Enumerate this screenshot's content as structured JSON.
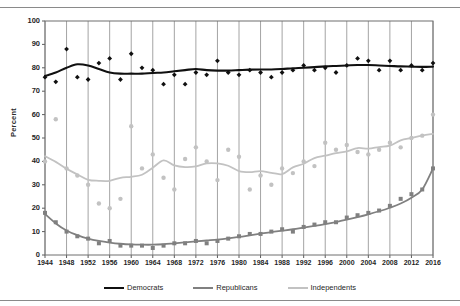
{
  "figure": {
    "title": "",
    "title_note": "title row is cropped off the top edge of the screenshot",
    "bottom_rule": true
  },
  "axes": {
    "ylabel": "Percent",
    "yticks": [
      "0",
      "10",
      "20",
      "30",
      "40",
      "50",
      "60",
      "70",
      "80",
      "90",
      "100"
    ],
    "xticks": [
      "1944",
      "1948",
      "1952",
      "1956",
      "1960",
      "1964",
      "1968",
      "1972",
      "1976",
      "1980",
      "1984",
      "1988",
      "1992",
      "1996",
      "2000",
      "2004",
      "2008",
      "2012",
      "2016"
    ]
  },
  "legend": {
    "items": [
      {
        "label": "Democrats",
        "color": "#101010"
      },
      {
        "label": "Republicans",
        "color": "#808080"
      },
      {
        "label": "Independents",
        "color": "#c2c2c2"
      }
    ]
  },
  "chart_data": {
    "type": "scatter",
    "title": "",
    "xlabel": "",
    "ylabel": "Percent",
    "xlim": [
      1944,
      2016
    ],
    "ylim": [
      0,
      100
    ],
    "ytick_step": 10,
    "xtick_step": 4,
    "grid": "vertical",
    "legend_position": "bottom-center",
    "marker_shapes": {
      "Democrats": "diamond",
      "Republicans": "square",
      "Independents": "circle"
    },
    "has_trend_lines": true,
    "x": [
      1944,
      1946,
      1948,
      1950,
      1952,
      1954,
      1956,
      1958,
      1960,
      1962,
      1964,
      1966,
      1968,
      1970,
      1972,
      1974,
      1976,
      1978,
      1980,
      1982,
      1984,
      1986,
      1988,
      1990,
      1992,
      1994,
      1996,
      1998,
      2000,
      2002,
      2004,
      2006,
      2008,
      2010,
      2012,
      2014,
      2016
    ],
    "series": [
      {
        "name": "Democrats",
        "color": "#101010",
        "values": [
          76,
          74,
          88,
          76,
          75,
          82,
          84,
          75,
          86,
          80,
          79,
          73,
          77,
          73,
          78,
          77,
          83,
          78,
          77,
          79,
          78,
          76,
          78,
          79,
          81,
          79,
          80,
          78,
          81,
          84,
          83,
          79,
          83,
          79,
          81,
          79,
          82
        ],
        "trend": [
          76.5,
          78,
          80,
          81.5,
          81,
          79.5,
          78,
          77.5,
          77.5,
          77.5,
          77.8,
          78,
          78.5,
          79,
          79.5,
          79,
          78.8,
          78.8,
          79,
          79.2,
          79.3,
          79.3,
          79.5,
          79.8,
          80,
          80.3,
          80.6,
          80.8,
          81,
          81.2,
          81.2,
          81,
          80.8,
          80.6,
          80.5,
          80.4,
          80.5
        ]
      },
      {
        "name": "Republicans",
        "color": "#808080",
        "values": [
          18,
          14,
          10,
          8,
          7,
          5,
          6,
          4,
          4,
          4,
          3,
          4,
          5,
          5,
          6,
          5,
          6,
          7,
          8,
          9,
          9,
          10,
          11,
          10,
          12,
          13,
          14,
          14,
          16,
          17,
          18,
          19,
          21,
          24,
          26,
          28,
          37
        ],
        "trend": [
          17.5,
          13.5,
          10.5,
          8.5,
          7,
          6,
          5.3,
          4.8,
          4.5,
          4.4,
          4.4,
          4.6,
          5,
          5.4,
          5.8,
          6.2,
          6.6,
          7.1,
          7.7,
          8.4,
          9.1,
          9.8,
          10.4,
          11,
          11.7,
          12.4,
          13.2,
          14.1,
          15.1,
          16.2,
          17.4,
          18.7,
          20.2,
          22,
          24.5,
          28,
          37
        ]
      },
      {
        "name": "Independents",
        "color": "#c2c2c2",
        "values": [
          40,
          58,
          37,
          34,
          30,
          22,
          20,
          24,
          55,
          37,
          43,
          33,
          28,
          41,
          46,
          40,
          32,
          45,
          42,
          28,
          34,
          30,
          37,
          35,
          40,
          38,
          48,
          45,
          47,
          44,
          43,
          45,
          48,
          46,
          50,
          51,
          60
        ]
      }
    ]
  }
}
